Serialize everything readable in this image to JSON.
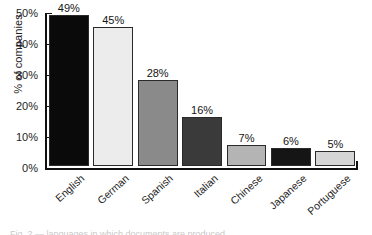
{
  "chart_data": {
    "type": "bar",
    "title": "",
    "xlabel": "",
    "ylabel": "% of companies",
    "categories": [
      "English",
      "German",
      "Spanish",
      "Italian",
      "Chinese",
      "Japanese",
      "Portuguese"
    ],
    "values": [
      49,
      45,
      28,
      16,
      7,
      6,
      5
    ],
    "value_labels": [
      "49%",
      "45%",
      "28%",
      "16%",
      "7%",
      "6%",
      "5%"
    ],
    "bar_colors": [
      "#0a0a0a",
      "#ececec",
      "#8a8a8a",
      "#3a3a3a",
      "#b4b4b4",
      "#151515",
      "#d5d5d5"
    ],
    "bar_edge_color": "#2a2a2a",
    "ylim": [
      0,
      50
    ],
    "yticks": [
      0,
      10,
      20,
      30,
      40,
      50
    ],
    "ytick_labels": [
      "0%",
      "10%",
      "20%",
      "30%",
      "40%",
      "50%"
    ],
    "grid": false,
    "legend": false,
    "legend_position": "none",
    "xtick_rotation": -42,
    "axis_color": "#111111"
  },
  "caption": {
    "text": "Fig. 2 — languages in which documents are produced"
  }
}
